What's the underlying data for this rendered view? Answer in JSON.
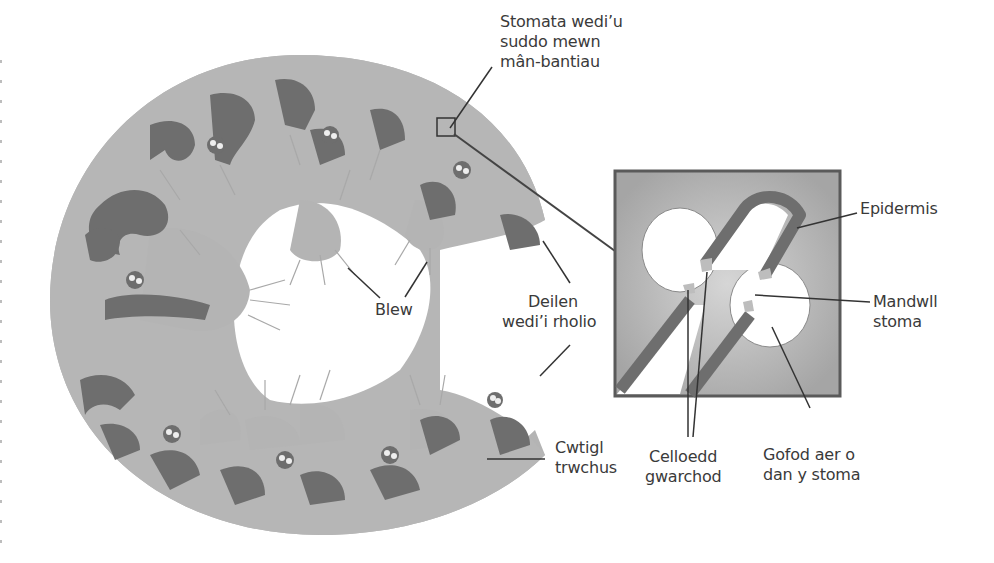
{
  "diagram": {
    "colors": {
      "background": "#ffffff",
      "leaf_tissue": "#b4b4b4",
      "dark_tissue": "#6e6e6e",
      "hairs": "#a8a8a8",
      "inset_fill": "#a9a9a9",
      "inset_border": "#5a5a5a",
      "leader_lines": "#333333",
      "label_text": "#3a3a3a"
    },
    "labels": {
      "sunken_stomata": {
        "line1": "Stomata wedi’u",
        "line2": "suddo mewn",
        "line3": "mân-bantiau"
      },
      "hairs": {
        "line1": "Blew"
      },
      "rolled_leaf": {
        "line1": "Deilen",
        "line2": "wedi’i rholio"
      },
      "thick_cuticle": {
        "line1": "Cwtigl",
        "line2": "trwchus"
      },
      "epidermis": {
        "line1": "Epidermis"
      },
      "stoma_pore": {
        "line1": "Mandwll",
        "line2": "stoma"
      },
      "guard_cells": {
        "line1": "Celloedd",
        "line2": "gwarchod"
      },
      "air_space": {
        "line1": "Gofod aer o",
        "line2": "dan y stoma"
      }
    }
  }
}
